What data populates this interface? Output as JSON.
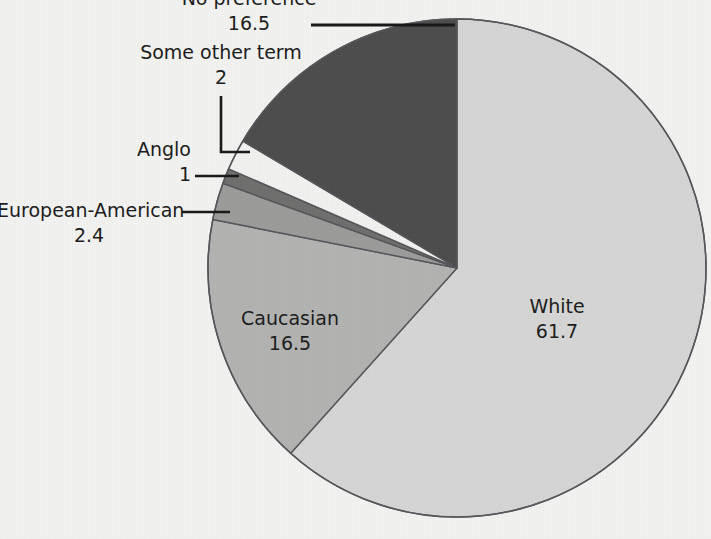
{
  "chart_data": {
    "type": "pie",
    "title": "",
    "subtitle": "",
    "xlabel": "",
    "ylabel": "",
    "legend_position": "none",
    "grid": false,
    "units": "percent",
    "categories": [
      "White",
      "Caucasian",
      "European-American",
      "Anglo",
      "Some other term",
      "No preference"
    ],
    "values": [
      61.7,
      16.5,
      2.4,
      1,
      2,
      16.5
    ],
    "value_labels": [
      "61.7",
      "16.5",
      "2.4",
      "1",
      "2",
      "16.5"
    ],
    "colors": [
      "#d5d6d4",
      "#b2b3b1",
      "#9b9c9a",
      "#6e6f6d",
      "#f1f1ef",
      "#4c4c4c"
    ],
    "start_angle_deg": 0,
    "direction": "clockwise",
    "slices": [
      {
        "label": "White",
        "value": 61.7,
        "value_label": "61.7",
        "color": "#d5d6d4",
        "label_placement": "inside"
      },
      {
        "label": "Caucasian",
        "value": 16.5,
        "value_label": "16.5",
        "color": "#b2b3b1",
        "label_placement": "inside"
      },
      {
        "label": "European-American",
        "value": 2.4,
        "value_label": "2.4",
        "color": "#9b9c9a",
        "label_placement": "outside"
      },
      {
        "label": "Anglo",
        "value": 1,
        "value_label": "1",
        "color": "#6e6f6d",
        "label_placement": "outside"
      },
      {
        "label": "Some other term",
        "value": 2,
        "value_label": "2",
        "color": "#f1f1ef",
        "label_placement": "outside"
      },
      {
        "label": "No preference",
        "value": 16.5,
        "value_label": "16.5",
        "color": "#4c4c4c",
        "label_placement": "outside"
      }
    ]
  },
  "labels": {
    "white": {
      "name": "White",
      "value": "61.7"
    },
    "caucasian": {
      "name": "Caucasian",
      "value": "16.5"
    },
    "european_american": {
      "name": "European-American",
      "value": "2.4"
    },
    "anglo": {
      "name": "Anglo",
      "value": "1"
    },
    "some_other_term": {
      "name": "Some other term",
      "value": "2"
    },
    "no_preference": {
      "name": "No preference",
      "value": "16.5"
    }
  },
  "style": {
    "background": "#f2f2f0",
    "outline": "#55555a",
    "leader_line": "#1a1a1a",
    "text": "#1a1a1a"
  }
}
